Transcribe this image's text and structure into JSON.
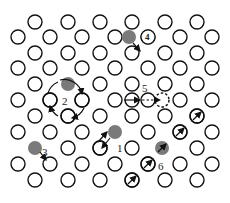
{
  "diagram": {
    "atom_radius": 7,
    "colors": {
      "atom_stroke": "#111111",
      "solute_fill": "#7a7a7a",
      "background": "#ffffff"
    },
    "lattice_rows": [
      {
        "y": 22,
        "x": [
          35,
          68,
          100,
          132,
          165,
          197
        ]
      },
      {
        "y": 37,
        "x": [
          18,
          50,
          82,
          115,
          180,
          212
        ]
      },
      {
        "y": 53,
        "x": [
          35,
          68,
          100,
          132,
          165,
          197
        ]
      },
      {
        "y": 68,
        "x": [
          18,
          50,
          82,
          115,
          148,
          180,
          212
        ]
      },
      {
        "y": 84,
        "x": [
          35,
          100,
          132,
          165,
          197
        ]
      },
      {
        "y": 100,
        "x": [
          18,
          50,
          82,
          115,
          180,
          212
        ]
      },
      {
        "y": 116,
        "x": [
          35,
          68,
          100,
          132,
          165,
          197
        ]
      },
      {
        "y": 132,
        "x": [
          18,
          50,
          82,
          148,
          180,
          212
        ]
      },
      {
        "y": 148,
        "x": [
          68,
          100,
          132,
          197
        ]
      },
      {
        "y": 164,
        "x": [
          18,
          50,
          82,
          115,
          148,
          180,
          212
        ]
      },
      {
        "y": 180,
        "x": [
          35,
          68,
          100,
          132,
          165,
          197
        ]
      }
    ],
    "solutes": [
      {
        "x": 129,
        "y": 37
      },
      {
        "x": 68,
        "y": 84
      },
      {
        "x": 115,
        "y": 132
      },
      {
        "x": 35,
        "y": 148
      },
      {
        "x": 162,
        "y": 148
      }
    ],
    "labels": [
      {
        "id": "1",
        "text": "1",
        "x": 117,
        "y": 152
      },
      {
        "id": "2",
        "text": "2",
        "x": 62,
        "y": 105
      },
      {
        "id": "3",
        "text": "3",
        "x": 42,
        "y": 156
      },
      {
        "id": "4",
        "text": "4",
        "x": 145,
        "y": 40
      },
      {
        "id": "5",
        "text": "5",
        "x": 142,
        "y": 92
      },
      {
        "id": "6",
        "text": "6",
        "x": 158,
        "y": 170
      }
    ]
  }
}
